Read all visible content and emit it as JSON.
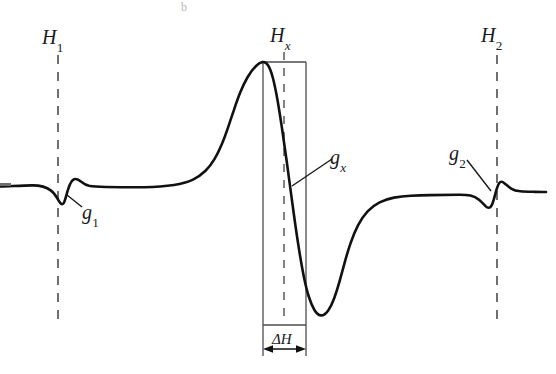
{
  "figure": {
    "kind": "epr-derivative-spectrum-diagram",
    "background_color": "#ffffff",
    "curve_color": "#111111",
    "guide_color": "#4d4d4d",
    "box_color": "#4d4d4d"
  },
  "labels": {
    "h1": {
      "base": "H",
      "sub": "1",
      "name": "field-h1"
    },
    "hx": {
      "base": "H",
      "sub": "x",
      "name": "field-hx"
    },
    "h2": {
      "base": "H",
      "sub": "2",
      "name": "field-h2"
    },
    "g1": {
      "base": "g",
      "sub": "1",
      "name": "g-factor-g1"
    },
    "gx": {
      "base": "g",
      "sub": "x",
      "name": "g-factor-gx"
    },
    "g2": {
      "base": "g",
      "sub": "2",
      "name": "g-factor-g2"
    },
    "delta_h": {
      "delta": "Δ",
      "base": "H",
      "name": "linewidth-delta-h"
    }
  },
  "artifacts": {
    "top_mark": "b"
  },
  "chart_data": {
    "type": "line",
    "title": "",
    "xlabel": "",
    "ylabel": "",
    "xlim": [
      0,
      556
    ],
    "ylim": [
      374,
      0
    ],
    "grid": false,
    "legend": false,
    "series": [
      {
        "name": "epr-derivative-signal",
        "color": "#111111",
        "stroke_width": 2.6,
        "path": "M 0,186.5 C 10,186.2 22,185.6 32,185.4 C 40,185.3 46,186.8 51,190.6 C 55,193.6 57,197.6 59,201.2 C 60.5,203.8 62,205.2 63.6,203.2 C 65.2,201.0 66.4,194.6 68,189.6 C 69.6,184.6 71.6,180.2 74,179.3 C 76.6,178.4 79.2,180.0 81.6,181.9 C 84,183.8 86.4,185.2 89,185.8 C 93,186.6 99,186.9 106,187.0 C 118,187.2 132,187.4 144,187.2 C 156,187.0 166,186.2 174,185.0 C 182,183.7 188,181.9 193,179.6 C 198,177.2 202,174.2 205.5,170.8 C 209,167.3 212,163.3 214.6,158.9 C 217.3,154.4 219.6,149.5 221.8,144.3 C 224,139.0 226,133.4 228,127.6 C 230,121.7 232,115.7 234,109.8 C 236,103.8 238,98.0 240.2,92.6 C 242.4,87.1 244.8,82.0 247.4,77.5 C 250,73.0 252.8,69.1 255.8,66.2 C 258.0,64.0 260.2,62.6 262.4,62.1 C 264.6,61.7 266.4,62.8 268.0,65.2 C 269.8,67.9 271.4,72.2 272.9,78.0 C 274.4,83.8 275.9,91.0 277.4,99.5 C 278.9,108.0 280.4,117.6 282.0,128.2 C 283.6,138.8 285.2,150.2 286.8,162.0 C 288.4,173.8 290.0,185.8 291.6,197.6 C 292.4,203.6 293.2,209.5 294.0,215.2 C 295.6,226.8 297.2,237.8 298.8,248.0 C 300.4,258.2 302.0,267.4 303.6,275.4 C 305.2,283.4 306.8,290.2 308.6,296.0 C 310.4,301.8 312.3,306.4 314.4,310.0 C 316.5,313.5 318.8,315.4 321.2,315.4 C 323.6,315.4 326.0,313.5 328.2,310.4 C 330.4,307.3 332.4,303.1 334.2,298.2 C 336.0,293.3 337.7,287.8 339.4,281.8 C 341.1,275.8 342.8,269.4 344.6,262.8 C 346.4,256.2 348.4,249.6 350.6,243.2 C 352.8,236.8 355.2,230.8 358.0,225.4 C 360.8,220.0 364.0,215.3 367.6,211.4 C 371.2,207.5 375.2,204.5 379.6,202.3 C 384.0,200.1 388.8,198.6 394.0,197.6 C 399.2,196.6 404.8,196.0 410.8,195.7 C 416.8,195.4 423.2,195.2 430,195.1 C 440,194.9 450,194.8 458,194.7 C 463,194.6 467,194.8 470.4,195.6 C 473.8,196.4 476.6,197.8 479.0,199.8 C 481.4,201.8 483.4,204.0 485.2,205.8 C 487.0,207.6 488.6,208.4 490.2,207.2 C 491.8,206.0 493.2,202.2 494.6,196.6 C 496.0,191.0 497.4,185.8 499.0,183.4 C 500.6,181.0 502.4,181.6 504.4,183.2 C 506.4,184.8 508.6,187.0 511.2,188.6 C 513.8,190.2 516.8,191.0 520.4,191.3 C 524.0,191.6 528.2,191.7 533,191.8 C 537.8,191.9 542,192.0 546,192.0"
      }
    ],
    "guides": [
      {
        "name": "h1-dashed-line",
        "x": 58,
        "y1": 55,
        "y2": 326,
        "style": "dashed"
      },
      {
        "name": "hx-dashed-line",
        "x": 284,
        "y1": 52,
        "y2": 322,
        "style": "dashed"
      },
      {
        "name": "h2-dashed-line",
        "x": 497,
        "y1": 55,
        "y2": 326,
        "style": "dashed"
      }
    ],
    "annotations": [
      {
        "name": "delta-h-box",
        "x1": 263,
        "y1": 62,
        "x2": 306,
        "y2": 325
      },
      {
        "name": "delta-h-arrow",
        "x1": 263,
        "y": 349,
        "x2": 306
      },
      {
        "name": "g1-leader-line",
        "x1": 67,
        "y1": 195,
        "x2": 82,
        "y2": 207
      },
      {
        "name": "gx-leader-line",
        "x1": 292,
        "y1": 186,
        "x2": 332,
        "y2": 159
      },
      {
        "name": "g2-leader-line",
        "x1": 491,
        "y1": 191,
        "x2": 467,
        "y2": 160
      }
    ]
  }
}
